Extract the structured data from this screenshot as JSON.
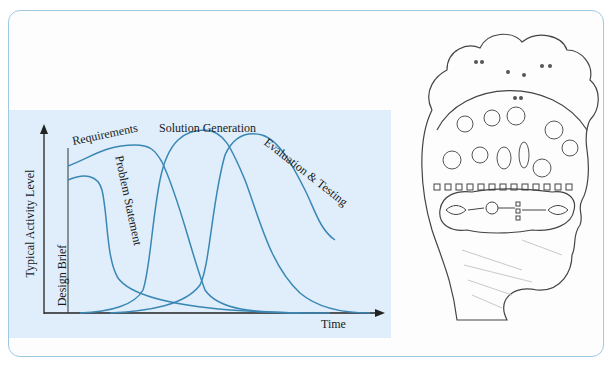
{
  "diagram": {
    "axes": {
      "y_label": "Typical Activity Level",
      "x_label": "Time"
    },
    "phases": [
      {
        "name": "Design Brief",
        "label": "Design Brief"
      },
      {
        "name": "Requirements",
        "label": "Requirements"
      },
      {
        "name": "Problem Statement",
        "label": "Problem Statement"
      },
      {
        "name": "Solution Generation",
        "label": "Solution Generation"
      },
      {
        "name": "Evaluation & Testing",
        "label": "Evaluation & Testing"
      }
    ],
    "colors": {
      "curve": "#3a87b5",
      "panel_bg": "#dfeefa",
      "frame_border": "#9fc9e3",
      "axis": "#222222"
    }
  },
  "illustration": {
    "description": "Pencil sketch of a human head in profile containing faces, light bulbs, checkbox circuits and an eye-to-bulb reasoning flow",
    "icon": "head-with-lightbulbs-icon"
  }
}
